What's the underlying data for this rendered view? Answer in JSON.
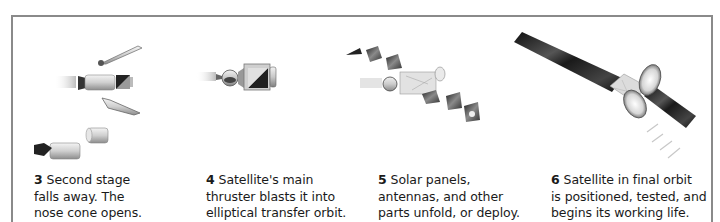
{
  "diagram": {
    "frame_color": "#8a8a8a",
    "steps": [
      {
        "number": "3",
        "lines": [
          "Second stage",
          "falls away. The",
          "nose cone opens."
        ],
        "illustration": "second-stage-separation"
      },
      {
        "number": "4",
        "lines": [
          "Satellite's main",
          "thruster blasts it into",
          "elliptical transfer orbit."
        ],
        "illustration": "satellite-thruster-firing"
      },
      {
        "number": "5",
        "lines": [
          "Solar panels,",
          "antennas, and other",
          "parts unfold, or deploy."
        ],
        "illustration": "satellite-deploying-panels"
      },
      {
        "number": "6",
        "lines": [
          "Satellite in final orbit",
          "is positioned, tested, and",
          "begins its working life."
        ],
        "illustration": "satellite-in-orbit"
      }
    ]
  }
}
